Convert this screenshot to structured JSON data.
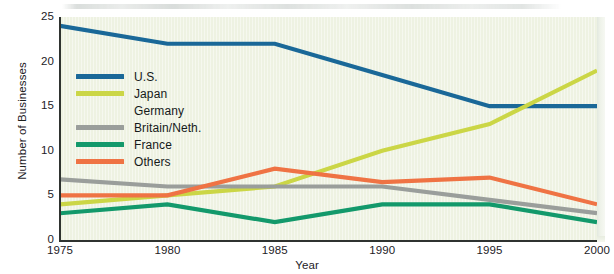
{
  "chart_data": {
    "type": "line",
    "title": "",
    "xlabel": "Year",
    "ylabel": "Number of Businesses",
    "categories": [
      "1975",
      "1980",
      "1985",
      "1990",
      "1995",
      "2000"
    ],
    "x": [
      1975,
      1980,
      1985,
      1990,
      1995,
      2000
    ],
    "xlim": [
      1975,
      2000
    ],
    "ylim": [
      0,
      25
    ],
    "yticks": [
      "0",
      "5",
      "10",
      "15",
      "20",
      "25"
    ],
    "ytick_values": [
      0,
      5,
      10,
      15,
      20,
      25
    ],
    "grid": false,
    "legend_position": "upper-left-inside",
    "series": [
      {
        "name": "U.S.",
        "color": "#1a6898",
        "values": [
          24,
          22,
          22,
          18.5,
          15,
          15
        ]
      },
      {
        "name": "Japan",
        "color": "#cbd646",
        "values": [
          4,
          5,
          6,
          10,
          13,
          19
        ]
      },
      {
        "name": "Germany",
        "color": "#f5c council",
        "values": [
          7,
          7,
          6,
          6,
          7,
          7
        ]
      },
      {
        "name": "Britain/Neth.",
        "color": "#9a9e9b",
        "values": [
          6.8,
          6,
          6,
          6,
          4.5,
          3
        ]
      },
      {
        "name": "France",
        "color": "#13996b",
        "values": [
          3,
          4,
          2,
          4,
          4,
          2
        ]
      },
      {
        "name": "Others",
        "color": "#ef7344",
        "values": [
          5,
          5,
          8,
          6.5,
          7,
          4
        ]
      }
    ]
  },
  "legend": {
    "items": [
      {
        "label": "U.S."
      },
      {
        "label": "Japan"
      },
      {
        "label": "Germany"
      },
      {
        "label": "Britain/Neth."
      },
      {
        "label": "France"
      },
      {
        "label": "Others"
      }
    ]
  },
  "axes": {
    "y_title": "Number of Businesses",
    "x_title": "Year"
  },
  "colors": {
    "panel_background": "#eef2e2",
    "page_background": "#ffffff",
    "axis": "#2f3330",
    "us": "#1a6898",
    "japan": "#cbd646",
    "germany": "#f5c453",
    "britain": "#9a9e9b",
    "france": "#13996b",
    "others": "#ef7344"
  }
}
